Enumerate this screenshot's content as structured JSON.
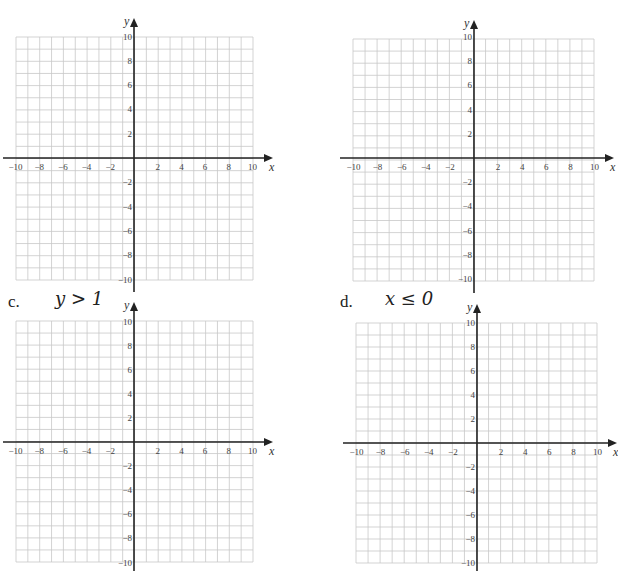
{
  "problems": [
    {
      "id": "a",
      "label": "",
      "inequality": "",
      "origin": [
        134,
        158
      ],
      "grid": {
        "left": 16,
        "right": 253,
        "top": 37,
        "bottom": 280
      }
    },
    {
      "id": "b",
      "label": "",
      "inequality": "",
      "origin": [
        474,
        158
      ],
      "grid": {
        "left": 353,
        "right": 594,
        "top": 39,
        "bottom": 281
      }
    },
    {
      "id": "c",
      "label": "c.",
      "inequality": "y > 1",
      "origin": [
        134,
        442
      ],
      "grid": {
        "left": 16,
        "right": 253,
        "top": 321,
        "bottom": 562
      }
    },
    {
      "id": "d",
      "label": "d.",
      "inequality": "x ≤ 0",
      "origin": [
        477,
        443
      ],
      "grid": {
        "left": 356,
        "right": 597,
        "top": 323,
        "bottom": 563
      }
    }
  ],
  "axes": {
    "x_label": "x",
    "y_label": "y",
    "x_ticks": [
      "−10",
      "−8",
      "−6",
      "−4",
      "−2",
      "2",
      "4",
      "6",
      "8",
      "10"
    ],
    "y_ticks": [
      "10",
      "8",
      "6",
      "4",
      "2",
      "−2",
      "−4",
      "−6",
      "−8",
      "−10"
    ]
  },
  "colors": {
    "grid": "#c8c8c8",
    "axis": "#222222",
    "text": "#333333"
  },
  "chart_data": [
    {
      "type": "grid",
      "title": "",
      "xlabel": "x",
      "ylabel": "y",
      "xlim": [
        -10,
        10
      ],
      "ylim": [
        -10,
        10
      ],
      "grid": true,
      "x_ticks": [
        -10,
        -8,
        -6,
        -4,
        -2,
        2,
        4,
        6,
        8,
        10
      ],
      "y_ticks": [
        -10,
        -8,
        -6,
        -4,
        -2,
        2,
        4,
        6,
        8,
        10
      ]
    },
    {
      "type": "grid",
      "title": "",
      "xlabel": "x",
      "ylabel": "y",
      "xlim": [
        -10,
        10
      ],
      "ylim": [
        -10,
        10
      ],
      "grid": true,
      "x_ticks": [
        -10,
        -8,
        -6,
        -4,
        -2,
        2,
        4,
        6,
        8,
        10
      ],
      "y_ticks": [
        -10,
        -8,
        -6,
        -4,
        -2,
        2,
        4,
        6,
        8,
        10
      ]
    },
    {
      "type": "grid",
      "title": "c. y > 1",
      "xlabel": "x",
      "ylabel": "y",
      "xlim": [
        -10,
        10
      ],
      "ylim": [
        -10,
        10
      ],
      "grid": true,
      "x_ticks": [
        -10,
        -8,
        -6,
        -4,
        -2,
        2,
        4,
        6,
        8,
        10
      ],
      "y_ticks": [
        -10,
        -8,
        -6,
        -4,
        -2,
        2,
        4,
        6,
        8,
        10
      ]
    },
    {
      "type": "grid",
      "title": "d. x ≤ 0",
      "xlabel": "x",
      "ylabel": "y",
      "xlim": [
        -10,
        10
      ],
      "ylim": [
        -10,
        10
      ],
      "grid": true,
      "x_ticks": [
        -10,
        -8,
        -6,
        -4,
        -2,
        2,
        4,
        6,
        8,
        10
      ],
      "y_ticks": [
        -10,
        -8,
        -6,
        -4,
        -2,
        2,
        4,
        6,
        8,
        10
      ]
    }
  ]
}
